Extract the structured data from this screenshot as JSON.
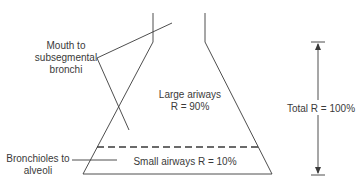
{
  "diagram": {
    "type": "airway-resistance-flask",
    "labels": {
      "mouth_to_subsegmental": {
        "line1": "Mouth to",
        "line2": "subsegmental",
        "line3": "bronchi"
      },
      "bronchioles_to_alveoli": {
        "line1": "Bronchioles to",
        "line2": "alveoli"
      },
      "large_airways": {
        "line1": "Large ariways",
        "line2": "R = 90%"
      },
      "small_airways": {
        "line1": "Small airways R = 10%"
      },
      "total": {
        "line1": "Total R = 100%"
      }
    },
    "colors": {
      "stroke": "#3a3a3a",
      "text": "#3a3a3a",
      "background": "#ffffff"
    }
  }
}
